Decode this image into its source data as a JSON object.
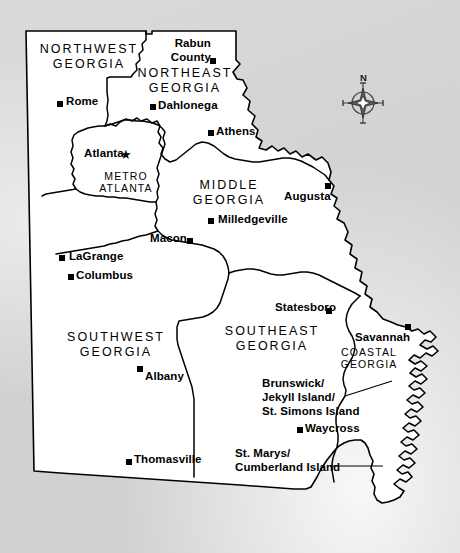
{
  "map": {
    "title": "Georgia Travel Regions Map",
    "subject": "State of Georgia, USA",
    "background_color": "#d5d5d5",
    "state_fill_color": "#ffffff",
    "border_color": "#000000",
    "compass": {
      "north_label": "N",
      "icon": "compass-rose-icon"
    },
    "regions": [
      {
        "id": "northwest-georgia",
        "label": "NORTHWEST\nGEORGIA",
        "x": 88,
        "y": 48,
        "size": "normal"
      },
      {
        "id": "northeast-georgia",
        "label": "NORTHEAST\nGEORGIA",
        "x": 183,
        "y": 72,
        "size": "normal"
      },
      {
        "id": "metro-atlanta",
        "label": "METRO\nATLANTA",
        "x": 126,
        "y": 174,
        "size": "small"
      },
      {
        "id": "middle-georgia",
        "label": "MIDDLE\nGEORGIA",
        "x": 228,
        "y": 180,
        "size": "normal"
      },
      {
        "id": "southwest-georgia",
        "label": "SOUTHWEST\nGEORGIA",
        "x": 114,
        "y": 336,
        "size": "normal"
      },
      {
        "id": "southeast-georgia",
        "label": "SOUTHEAST\nGEORGIA",
        "x": 270,
        "y": 326,
        "size": "normal"
      },
      {
        "id": "coastal-georgia",
        "label": "COASTAL\nGEORGIA",
        "x": 368,
        "y": 340,
        "size": "small"
      }
    ],
    "cities": [
      {
        "id": "rabun-county",
        "label": "Rabun\nCounty",
        "marker_x": 213,
        "marker_y": 61,
        "label_x": 172,
        "label_y": 38,
        "align": "right",
        "marker": "square"
      },
      {
        "id": "rome",
        "label": "Rome",
        "marker_x": 60,
        "marker_y": 104,
        "label_x": 69,
        "label_y": 95,
        "align": "left",
        "marker": "square"
      },
      {
        "id": "dahlonega",
        "label": "Dahlonega",
        "marker_x": 153,
        "marker_y": 107,
        "label_x": 161,
        "label_y": 99,
        "align": "left",
        "marker": "square"
      },
      {
        "id": "athens",
        "label": "Athens",
        "marker_x": 211,
        "marker_y": 133,
        "label_x": 219,
        "label_y": 125,
        "align": "left",
        "marker": "square"
      },
      {
        "id": "atlanta",
        "label": "Atlanta",
        "marker_x": 126,
        "marker_y": 154,
        "label_x": 86,
        "label_y": 147,
        "align": "left",
        "marker": "star"
      },
      {
        "id": "augusta",
        "label": "Augusta",
        "marker_x": 328,
        "marker_y": 186,
        "label_x": 288,
        "label_y": 190,
        "align": "left",
        "marker": "square"
      },
      {
        "id": "milledgeville",
        "label": "Milledgeville",
        "marker_x": 211,
        "marker_y": 221,
        "label_x": 220,
        "label_y": 213,
        "align": "left",
        "marker": "square"
      },
      {
        "id": "macon",
        "label": "Macon",
        "marker_x": 190,
        "marker_y": 241,
        "label_x": 153,
        "label_y": 232,
        "align": "left",
        "marker": "square"
      },
      {
        "id": "lagrange",
        "label": "LaGrange",
        "marker_x": 62,
        "marker_y": 258,
        "label_x": 71,
        "label_y": 250,
        "align": "left",
        "marker": "square"
      },
      {
        "id": "columbus",
        "label": "Columbus",
        "marker_x": 71,
        "marker_y": 277,
        "label_x": 76,
        "label_y": 268,
        "align": "left",
        "marker": "square"
      },
      {
        "id": "statesboro",
        "label": "Statesboro",
        "marker_x": 329,
        "marker_y": 311,
        "label_x": 278,
        "label_y": 301,
        "align": "left",
        "marker": "square"
      },
      {
        "id": "savannah",
        "label": "Savannah",
        "marker_x": 408,
        "marker_y": 327,
        "label_x": 358,
        "label_y": 331,
        "align": "left",
        "marker": "square"
      },
      {
        "id": "albany",
        "label": "Albany",
        "marker_x": 140,
        "marker_y": 369,
        "label_x": 146,
        "label_y": 370,
        "align": "left",
        "marker": "square"
      },
      {
        "id": "brunswick-jekyll-st-simons",
        "label": "Brunswick/\nJekyll Island/\nSt. Simons Island",
        "marker_x": null,
        "marker_y": null,
        "label_x": 264,
        "label_y": 377,
        "align": "left",
        "marker": "leader-line"
      },
      {
        "id": "waycross",
        "label": "Waycross",
        "marker_x": 300,
        "marker_y": 430,
        "label_x": 307,
        "label_y": 422,
        "align": "left",
        "marker": "square"
      },
      {
        "id": "thomasville",
        "label": "Thomasville",
        "marker_x": 129,
        "marker_y": 462,
        "label_x": 136,
        "label_y": 453,
        "align": "left",
        "marker": "square"
      },
      {
        "id": "st-marys-cumberland",
        "label": "St. Marys/\nCumberland Island",
        "marker_x": null,
        "marker_y": null,
        "label_x": 238,
        "label_y": 446,
        "align": "left",
        "marker": "leader-line"
      }
    ],
    "leader_lines": [
      {
        "id": "brunswick-leader",
        "x1": 345,
        "y1": 408,
        "x2": 387,
        "y2": 389
      },
      {
        "id": "st-marys-leader",
        "x1": 330,
        "y1": 468,
        "x2": 381,
        "y2": 468
      }
    ]
  }
}
